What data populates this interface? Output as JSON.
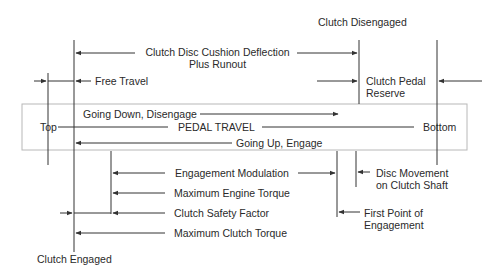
{
  "diagram": {
    "states": {
      "disengaged": "Clutch Disengaged",
      "engaged": "Clutch Engaged"
    },
    "pedal_travel_box": {
      "label": "PEDAL TRAVEL",
      "start": "Top",
      "end": "Bottom",
      "going_down": "Going Down, Disengage",
      "going_up": "Going Up, Engage"
    },
    "upper_dimensions": [
      {
        "id": "cushion",
        "line1": "Clutch Disc Cushion Deflection",
        "line2": "Plus Runout"
      },
      {
        "id": "free_travel",
        "label": "Free Travel"
      },
      {
        "id": "reserve",
        "line1": "Clutch Pedal",
        "line2": "Reserve"
      }
    ],
    "lower_dimensions": [
      {
        "id": "modulation",
        "label": "Engagement Modulation"
      },
      {
        "id": "max_engine_torque",
        "label": "Maximum Engine Torque"
      },
      {
        "id": "safety_factor",
        "label": "Clutch Safety Factor"
      },
      {
        "id": "max_clutch_torque",
        "label": "Maximum Clutch Torque"
      }
    ],
    "right_annotations": [
      {
        "id": "disc_movement",
        "line1": "Disc Movement",
        "line2": "on Clutch Shaft"
      },
      {
        "id": "first_point",
        "line1": "First Point of",
        "line2": "Engagement"
      }
    ],
    "colors": {
      "line": "#333333",
      "box_border": "#b8b8b8",
      "text": "#2a2a2a",
      "background": "#ffffff"
    }
  }
}
